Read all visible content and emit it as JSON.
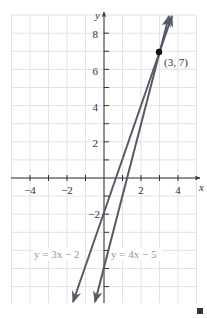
{
  "chart_data": {
    "type": "line",
    "title": "",
    "xlabel": "x",
    "ylabel": "y",
    "xlim": [
      -5,
      5
    ],
    "ylim": [
      -7,
      9
    ],
    "grid": true,
    "x_ticks": [
      -4,
      -3,
      -2,
      -1,
      1,
      2,
      3,
      4
    ],
    "x_tick_labels": [
      "−4",
      "−2",
      "2",
      "4"
    ],
    "x_tick_label_values": [
      -4,
      -2,
      2,
      4
    ],
    "y_ticks": [
      -6,
      -5,
      -4,
      -3,
      -2,
      -1,
      1,
      2,
      3,
      4,
      5,
      6,
      7,
      8
    ],
    "y_tick_labels": [
      "8",
      "6",
      "4",
      "2",
      "−2"
    ],
    "y_tick_label_values": [
      8,
      6,
      4,
      2,
      -2
    ],
    "series": [
      {
        "name": "y = 3x − 2",
        "slope": 3,
        "intercept": -2,
        "x": [
          -1.67,
          3.67
        ],
        "y": [
          -7,
          9
        ],
        "color": "#555b66"
      },
      {
        "name": "y = 4x − 5",
        "slope": 4,
        "intercept": -5,
        "x": [
          -0.5,
          3.5
        ],
        "y": [
          -7,
          9
        ],
        "color": "#555b66"
      }
    ],
    "annotations": [
      {
        "type": "point",
        "x": 3,
        "y": 7,
        "label": "(3, 7)"
      },
      {
        "type": "text",
        "text": "y = 3x − 2",
        "x": -4.5,
        "y": -4.4
      },
      {
        "type": "text",
        "text": "y = 4x − 5",
        "x": 0.2,
        "y": -4.4
      }
    ],
    "legend": "none"
  },
  "colors": {
    "grid": "#e2e2e2",
    "axis": "#333333",
    "line": "#555b66",
    "label": "#8a9aaa",
    "marker": "#111111"
  },
  "labels": {
    "x_axis": "x",
    "y_axis": "y",
    "point": "(3, 7)",
    "eq1": "y = 3x − 2",
    "eq2": "y = 4x − 5",
    "xt_m4": "−4",
    "xt_m2": "−2",
    "xt_2": "2",
    "xt_4": "4",
    "yt_8": "8",
    "yt_6": "6",
    "yt_4": "4",
    "yt_2": "2",
    "yt_m2": "−2"
  }
}
